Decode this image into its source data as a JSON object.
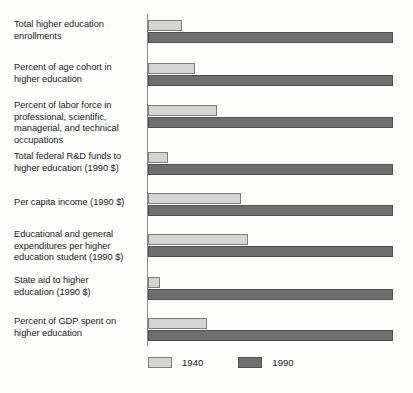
{
  "chart_data": {
    "type": "bar",
    "orientation": "horizontal",
    "title": "",
    "subtitle": "",
    "xlabel": "",
    "ylabel": "",
    "grid": false,
    "legend_position": "bottom",
    "xlim": [
      0,
      100
    ],
    "note": "All 1990 bars are drawn at full scale (index = 100); 1940 bars are drawn relative to the 1990 value for the same measure.",
    "categories": [
      "Total higher education enrollments",
      "Percent of age cohort in higher education",
      "Percent of labor force in professional, scientific, managerial, and technical occupations",
      "Total federal R&D funds to higher education (1990 $)",
      "Per capita income (1990 $)",
      "Educational and general expenditures per higher education student (1990 $)",
      "State aid to higher education (1990 $)",
      "Percent of GDP spent on higher education"
    ],
    "series": [
      {
        "name": "1940",
        "color": "#d4d4d2",
        "values": [
          14,
          19,
          28,
          8,
          38,
          41,
          5,
          24
        ]
      },
      {
        "name": "1990",
        "color": "#6e6e6e",
        "values": [
          100,
          100,
          100,
          100,
          100,
          100,
          100,
          100
        ]
      }
    ]
  },
  "legend": {
    "items": [
      {
        "label": "1940",
        "swatch": "swatch-1940"
      },
      {
        "label": "1990",
        "swatch": "swatch-1990"
      }
    ]
  },
  "labels": {
    "rows": [
      {
        "lines": [
          "Total higher education",
          "enrollments"
        ]
      },
      {
        "lines": [
          "Percent of age cohort in",
          "higher education"
        ]
      },
      {
        "lines": [
          "Percent of labor force in",
          "professional, scientific,",
          "managerial, and technical",
          "occupations"
        ]
      },
      {
        "lines": [
          "Total federal R&D funds to",
          "higher education (1990 $)"
        ]
      },
      {
        "lines": [
          "Per capita income (1990 $)"
        ]
      },
      {
        "lines": [
          "Educational and general",
          "expenditures per higher",
          "education student (1990 $)"
        ]
      },
      {
        "lines": [
          "State aid to higher",
          "education (1990 $)"
        ]
      },
      {
        "lines": [
          "Percent of GDP spent on",
          "higher education"
        ]
      }
    ]
  }
}
